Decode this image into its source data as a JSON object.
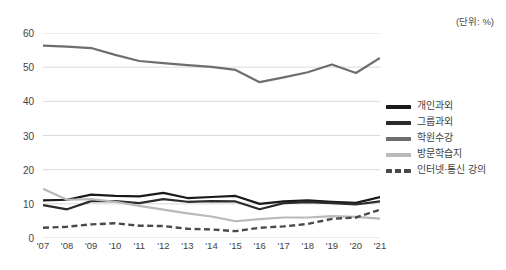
{
  "unit_note": "(단위: %)",
  "legend": {
    "position": "right",
    "items": [
      {
        "label": "개인과외",
        "color": "#1a1a1a",
        "style": "solid"
      },
      {
        "label": "그룹과외",
        "color": "#2b2b2b",
        "style": "solid"
      },
      {
        "label": "학원수강",
        "color": "#6e6e6e",
        "style": "solid"
      },
      {
        "label": "방문학습지",
        "color": "#b9b9b9",
        "style": "solid"
      },
      {
        "label": "인터넷·통신 강의",
        "color": "#4a4a4a",
        "style": "dashed"
      }
    ]
  },
  "chart_data": {
    "type": "line",
    "title": "",
    "subtitle": "",
    "xlabel": "",
    "ylabel": "",
    "unit": "%",
    "grid": true,
    "legend_position": "right",
    "ylim": [
      0,
      60
    ],
    "yticks": [
      0,
      10,
      20,
      30,
      40,
      50,
      60
    ],
    "categories": [
      "'07",
      "'08",
      "'09",
      "'10",
      "'11",
      "'12",
      "'13",
      "'14",
      "'15",
      "'16",
      "'17",
      "'18",
      "'19",
      "'20",
      "'21"
    ],
    "series": [
      {
        "name": "학원수강",
        "color": "#6e6e6e",
        "style": "solid",
        "values": [
          56.3,
          56.0,
          55.6,
          53.6,
          51.8,
          51.2,
          50.6,
          50.1,
          49.2,
          45.6,
          47.0,
          48.5,
          50.8,
          48.3,
          52.7
        ]
      },
      {
        "name": "개인과외",
        "color": "#1a1a1a",
        "style": "solid",
        "values": [
          11.0,
          11.2,
          12.7,
          12.3,
          12.2,
          13.2,
          11.7,
          12.0,
          12.3,
          10.0,
          10.7,
          11.0,
          10.6,
          10.3,
          12.0
        ]
      },
      {
        "name": "그룹과외",
        "color": "#2b2b2b",
        "style": "solid",
        "values": [
          9.6,
          8.4,
          10.8,
          10.8,
          10.2,
          11.4,
          10.6,
          10.8,
          10.7,
          8.4,
          10.2,
          10.5,
          10.2,
          9.8,
          10.7
        ]
      },
      {
        "name": "방문학습지",
        "color": "#b9b9b9",
        "style": "solid",
        "values": [
          14.4,
          11.2,
          11.4,
          10.6,
          9.4,
          8.3,
          7.2,
          6.3,
          4.9,
          5.5,
          6.0,
          6.0,
          6.4,
          6.2,
          5.7
        ]
      },
      {
        "name": "인터넷·통신 강의",
        "color": "#4a4a4a",
        "style": "dashed",
        "values": [
          3.0,
          3.3,
          4.0,
          4.3,
          3.6,
          3.5,
          2.7,
          2.5,
          2.0,
          3.0,
          3.4,
          4.1,
          5.6,
          6.0,
          8.3
        ]
      }
    ]
  }
}
